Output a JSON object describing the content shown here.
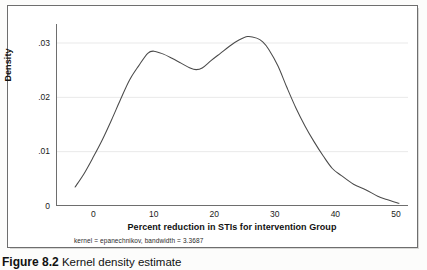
{
  "caption": {
    "number": "Figure 8.2",
    "text": "Kernel density estimate"
  },
  "chart_data": {
    "type": "line",
    "title": "",
    "xlabel": "Percent reduction in STIs for intervention Group",
    "ylabel": "Density",
    "note": "kernel = epanechnikov, bandwidth = 3.3687",
    "xlim": [
      -5,
      52
    ],
    "ylim": [
      0,
      0.0335
    ],
    "xticks": [
      0,
      10,
      20,
      30,
      40,
      50
    ],
    "xtick_labels": [
      "0",
      "10",
      "20",
      "30",
      "40",
      "50"
    ],
    "yticks": [
      0,
      0.01,
      0.02,
      0.03
    ],
    "ytick_labels": [
      "0",
      ".01",
      ".02",
      ".03"
    ],
    "grid": "horizontal",
    "legend": "none",
    "series": [
      {
        "name": "Kernel density",
        "x": [
          -3.0,
          -1.5,
          0.0,
          1.5,
          3.0,
          4.5,
          6.0,
          7.5,
          9.0,
          10.0,
          11.5,
          13.0,
          14.5,
          16.0,
          17.0,
          18.0,
          19.5,
          21.0,
          22.5,
          24.0,
          25.5,
          27.0,
          28.0,
          29.0,
          30.5,
          32.0,
          33.5,
          35.0,
          36.5,
          38.0,
          39.5,
          41.0,
          43.0,
          45.0,
          47.0,
          48.5,
          50.5
        ],
        "y": [
          0.0035,
          0.006,
          0.009,
          0.0122,
          0.0158,
          0.0196,
          0.0232,
          0.0258,
          0.0281,
          0.0285,
          0.028,
          0.0272,
          0.0263,
          0.0254,
          0.0251,
          0.0254,
          0.0268,
          0.0281,
          0.0294,
          0.0305,
          0.0312,
          0.0309,
          0.0302,
          0.0288,
          0.0258,
          0.0218,
          0.018,
          0.0147,
          0.0118,
          0.0092,
          0.0069,
          0.0056,
          0.004,
          0.003,
          0.0018,
          0.0012,
          0.0005
        ]
      }
    ]
  },
  "colors": {
    "line": "#4a4a4a",
    "axis": "#6e6e6e",
    "grid": "#e9e9e9",
    "frame": "#6e6e6e",
    "text": "#111111"
  }
}
